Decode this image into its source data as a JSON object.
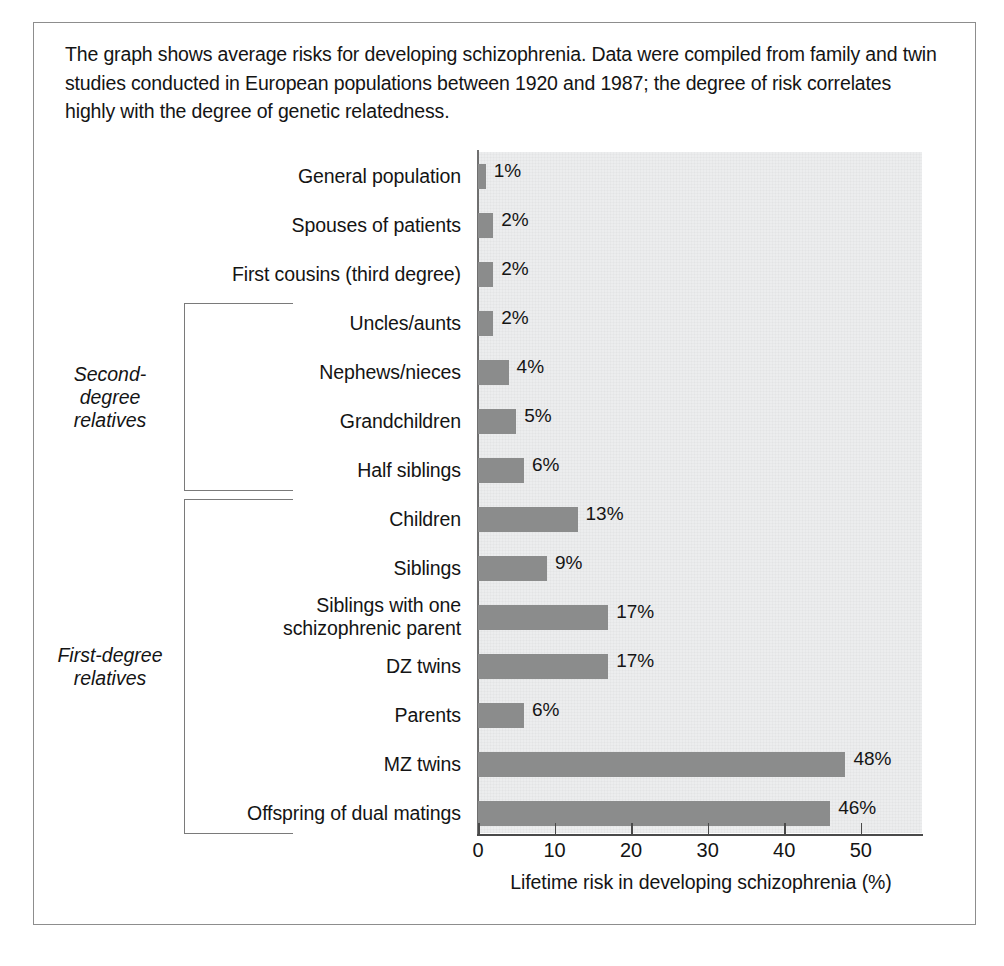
{
  "caption": "The graph shows average risks for developing schizophrenia. Data were compiled from family and twin studies conducted in European populations between 1920 and 1987; the degree of risk correlates highly with the degree of genetic relatedness.",
  "groups": [
    {
      "id": "second-degree",
      "label": "Second-\ndegree\nrelatives",
      "first_index": 3,
      "last_index": 6
    },
    {
      "id": "first-degree",
      "label": "First-degree\nrelatives",
      "first_index": 7,
      "last_index": 13
    }
  ],
  "colors": {
    "bar_fill": "#8b8c8c",
    "plot_background": "#ecedee",
    "axis_line": "#4a4a4a",
    "bracket_line": "#7a7a7a",
    "border": "#8d8d8d",
    "text": "#141414"
  },
  "chart_data": {
    "type": "bar",
    "orientation": "horizontal",
    "title": "",
    "xlabel": "Lifetime risk in developing schizophrenia (%)",
    "ylabel": "",
    "xlim": [
      0,
      58
    ],
    "xticks": [
      0,
      10,
      20,
      30,
      40,
      50
    ],
    "xtick_labels": [
      "0",
      "10",
      "20",
      "30",
      "40",
      "50"
    ],
    "grid": false,
    "legend": "none",
    "value_suffix": "%",
    "categories": [
      "General population",
      "Spouses of patients",
      "First cousins (third degree)",
      "Uncles/aunts",
      "Nephews/nieces",
      "Grandchildren",
      "Half siblings",
      "Children",
      "Siblings",
      "Siblings with one\nschizophrenic parent",
      "DZ twins",
      "Parents",
      "MZ twins",
      "Offspring of dual matings"
    ],
    "values": [
      1,
      2,
      2,
      2,
      4,
      5,
      6,
      13,
      9,
      17,
      17,
      6,
      48,
      46
    ],
    "value_labels": [
      "1%",
      "2%",
      "2%",
      "2%",
      "4%",
      "5%",
      "6%",
      "13%",
      "9%",
      "17%",
      "17%",
      "6%",
      "48%",
      "46%"
    ]
  }
}
